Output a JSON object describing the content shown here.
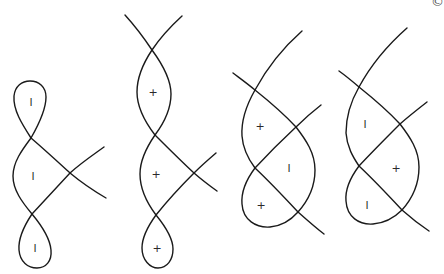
{
  "diagram": {
    "stroke_color": "#1a1a1a",
    "figures": [
      {
        "id": "figure-1",
        "regions": [
          {
            "label": "l",
            "x": 31,
            "y": 102
          },
          {
            "label": "l",
            "x": 33,
            "y": 176
          },
          {
            "label": "l",
            "x": 35,
            "y": 248
          }
        ]
      },
      {
        "id": "figure-2",
        "regions": [
          {
            "label": "+",
            "x": 153,
            "y": 92
          },
          {
            "label": "+",
            "x": 156,
            "y": 174
          },
          {
            "label": "+",
            "x": 157,
            "y": 248
          }
        ]
      },
      {
        "id": "figure-3",
        "regions": [
          {
            "label": "+",
            "x": 260,
            "y": 126
          },
          {
            "label": "l",
            "x": 289,
            "y": 168
          },
          {
            "label": "+",
            "x": 261,
            "y": 205
          }
        ]
      },
      {
        "id": "figure-4",
        "regions": [
          {
            "label": "l",
            "x": 365,
            "y": 124
          },
          {
            "label": "+",
            "x": 396,
            "y": 168
          },
          {
            "label": "l",
            "x": 367,
            "y": 205
          }
        ]
      }
    ],
    "corner_mark": "©"
  }
}
